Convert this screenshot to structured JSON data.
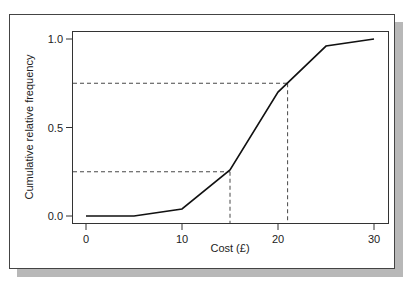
{
  "chart_data": {
    "type": "line",
    "title": "",
    "xlabel": "Cost (£)",
    "ylabel": "Cumulative relative frequency",
    "x": [
      0,
      5,
      10,
      15,
      20,
      25,
      30
    ],
    "series": [
      {
        "name": "Cumulative relative frequency",
        "values": [
          0.0,
          0.0,
          0.04,
          0.26,
          0.7,
          0.96,
          1.0
        ]
      }
    ],
    "xlim": [
      -1.5,
      31.5
    ],
    "ylim": [
      -0.05,
      1.05
    ],
    "xticks": [
      "0",
      "10",
      "20",
      "30"
    ],
    "yticks": [
      "0.0",
      "0.5",
      "1.0"
    ],
    "grid": false,
    "annotations": [
      {
        "type": "dashed-guide",
        "y": 0.25,
        "x": 15,
        "note": "lower quartile"
      },
      {
        "type": "dashed-guide",
        "y": 0.75,
        "x": 21,
        "note": "upper quartile"
      }
    ]
  },
  "axes": {
    "xlabel": "Cost (£)",
    "ylabel": "Cumulative relative frequency",
    "xticks": [
      {
        "v": 0,
        "label": "0"
      },
      {
        "v": 10,
        "label": "10"
      },
      {
        "v": 20,
        "label": "20"
      },
      {
        "v": 30,
        "label": "30"
      }
    ],
    "yticks": [
      {
        "v": 0,
        "label": "0.0"
      },
      {
        "v": 0.5,
        "label": "0.5"
      },
      {
        "v": 1.0,
        "label": "1.0"
      }
    ]
  }
}
